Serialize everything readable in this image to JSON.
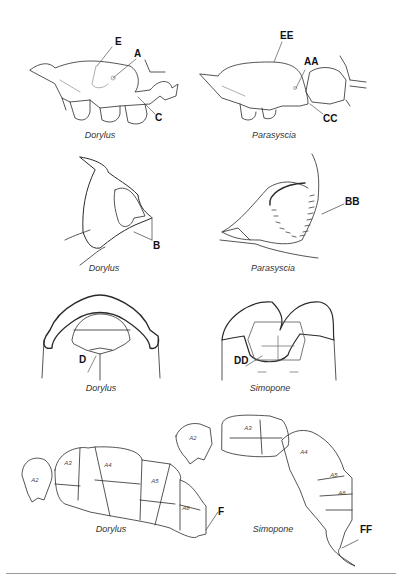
{
  "panels": [
    {
      "id": "mesosoma-lateral",
      "left": {
        "caption": "Dorylus",
        "labels": [
          "E",
          "A",
          "C"
        ]
      },
      "right": {
        "caption": "Parasyscia",
        "labels": [
          "EE",
          "AA",
          "CC"
        ]
      }
    },
    {
      "id": "propodeum-detail",
      "left": {
        "caption": "Dorylus",
        "labels": [
          "B"
        ]
      },
      "right": {
        "caption": "Parasyscia",
        "labels": [
          "BB"
        ]
      }
    },
    {
      "id": "head-ventral",
      "left": {
        "caption": "Dorylus",
        "labels": [
          "D"
        ]
      },
      "right": {
        "caption": "Simopone",
        "labels": [
          "DD"
        ]
      }
    },
    {
      "id": "gaster-lateral",
      "left": {
        "caption": "Dorylus",
        "labels": [
          "F"
        ],
        "segments": [
          "A2",
          "A3",
          "A4",
          "A5",
          "A6"
        ]
      },
      "right": {
        "caption": "Simopone",
        "labels": [
          "FF"
        ],
        "segments": [
          "A2",
          "A3",
          "A4",
          "A5",
          "A6"
        ]
      }
    }
  ],
  "colors": {
    "line": "#2a2a2a",
    "light_line": "#9a9a9a",
    "rule": "#9a9a9a",
    "background": "#ffffff"
  }
}
